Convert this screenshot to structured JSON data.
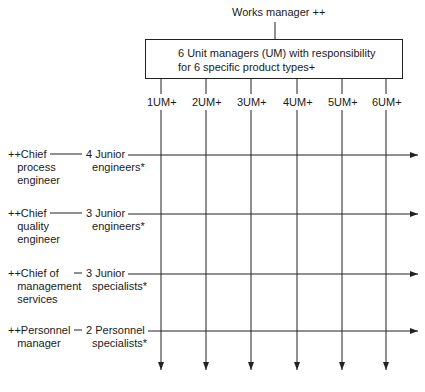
{
  "top": {
    "label": "Works manager ++"
  },
  "box": {
    "line1": "6 Unit managers (UM) with responsibility",
    "line2": "for 6 specific product types+"
  },
  "units": [
    {
      "label": "1UM+",
      "x": 161
    },
    {
      "label": "2UM+",
      "x": 206
    },
    {
      "label": "3UM+",
      "x": 251
    },
    {
      "label": "4UM+",
      "x": 297
    },
    {
      "label": "5UM+",
      "x": 342
    },
    {
      "label": "6UM+",
      "x": 386
    }
  ],
  "functions": [
    {
      "chief_line1": "++Chief",
      "chief_line2": "process",
      "chief_line3": "engineer",
      "staff_line1": "4 Junior",
      "staff_line2": "engineers*",
      "y": 155
    },
    {
      "chief_line1": "++Chief",
      "chief_line2": "quality",
      "chief_line3": "engineer",
      "staff_line1": "3 Junior",
      "staff_line2": "engineers*",
      "y": 214
    },
    {
      "chief_line1": "++Chief of",
      "chief_line2": "management",
      "chief_line3": "services",
      "staff_line1": "3 Junior",
      "staff_line2": "specialists*",
      "y": 274
    },
    {
      "chief_line1": "++Personnel",
      "chief_line2": "manager",
      "chief_line3": "",
      "staff_line1": "2 Personnel",
      "staff_line2": "specialists*",
      "y": 331
    }
  ]
}
